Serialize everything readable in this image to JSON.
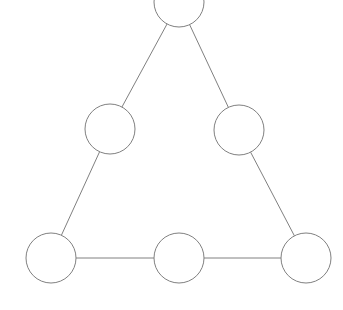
{
  "diagram": {
    "background_color": "#ffffff",
    "node_fill_color": "#ffffff",
    "node_stroke_color": "#808080",
    "edge_color": "#808080",
    "edge_width": 1,
    "node_stroke_width": 1,
    "node_radius": 25,
    "nodes": [
      {
        "id": "node-top",
        "label": "",
        "cx": 179,
        "cy": 2,
        "r": 25
      },
      {
        "id": "node-mid-left",
        "label": "",
        "cx": 110,
        "cy": 129,
        "r": 25
      },
      {
        "id": "node-mid-right",
        "label": "",
        "cx": 239,
        "cy": 130,
        "r": 25
      },
      {
        "id": "node-bottom-left",
        "label": "",
        "cx": 51,
        "cy": 258,
        "r": 25
      },
      {
        "id": "node-bottom-mid",
        "label": "",
        "cx": 179,
        "cy": 258,
        "r": 25
      },
      {
        "id": "node-bottom-right",
        "label": "",
        "cx": 306,
        "cy": 258,
        "r": 25
      }
    ],
    "edges": [
      {
        "id": "edge-top-midleft",
        "from": "node-top",
        "to": "node-mid-left"
      },
      {
        "id": "edge-top-midright",
        "from": "node-top",
        "to": "node-mid-right"
      },
      {
        "id": "edge-midleft-bottomleft",
        "from": "node-mid-left",
        "to": "node-bottom-left"
      },
      {
        "id": "edge-midright-bottomright",
        "from": "node-mid-right",
        "to": "node-bottom-right"
      },
      {
        "id": "edge-bottomleft-bottommid",
        "from": "node-bottom-left",
        "to": "node-bottom-mid"
      },
      {
        "id": "edge-bottommid-bottomright",
        "from": "node-bottom-mid",
        "to": "node-bottom-right"
      }
    ]
  }
}
